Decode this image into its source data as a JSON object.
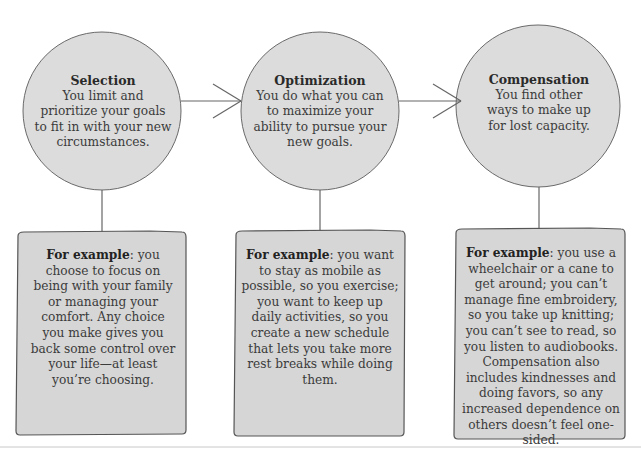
{
  "stages": [
    {
      "title": "Selection",
      "description": "You limit and prioritize your goals to fit in with your new circumstances.",
      "example_lead": "For example",
      "example_text": ": you choose to focus on being with your family or managing your comfort. Any choice you make gives you back some control over your life—at least you’re choosing."
    },
    {
      "title": "Optimization",
      "description": "You do what you can to maximize your ability to pursue your new goals.",
      "example_lead": "For example",
      "example_text": ": you want to stay as mobile as possible, so you exercise; you want to keep up daily activities, so you create a new schedule that lets you take more rest breaks while doing them."
    },
    {
      "title": "Compensation",
      "description": "You find other ways to make up for lost capacity.",
      "example_lead": "For example",
      "example_text": ": you use a wheelchair or a cane to get around; you can’t manage fine embroidery, so you take up knitting; you can’t see to read, so you listen to audiobooks. Compensation also includes kindnesses and doing favors, so any increased dependence on others doesn’t feel one-sided."
    }
  ],
  "colors": {
    "circle_fill": "#dcdcdc",
    "box_fill": "#d6d6d6",
    "stroke": "#555555"
  }
}
